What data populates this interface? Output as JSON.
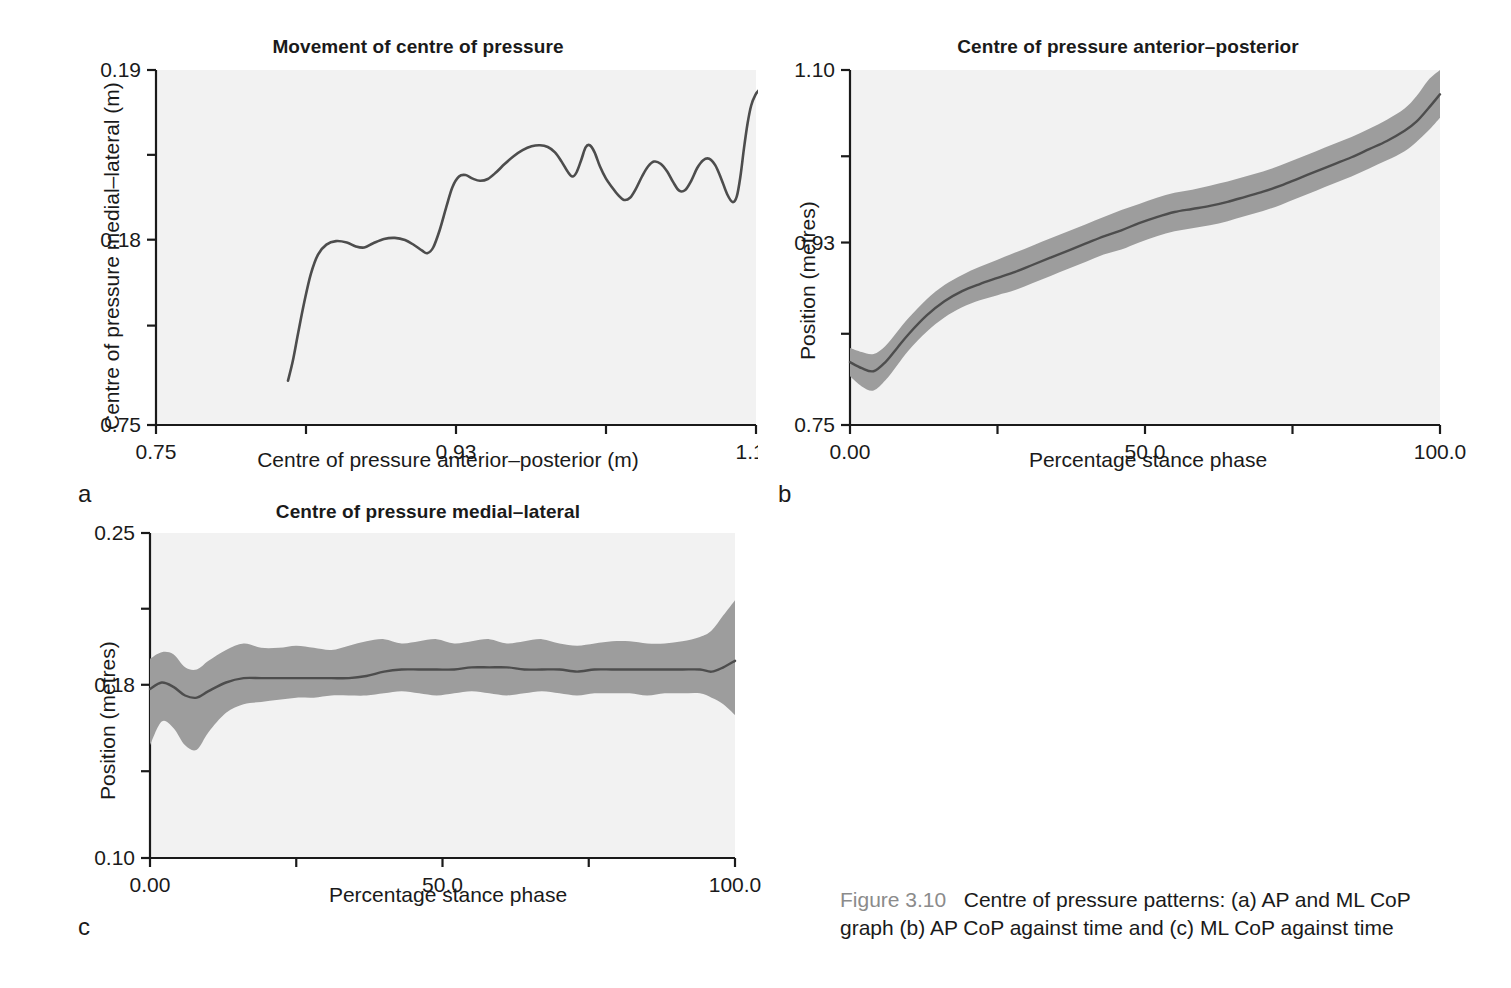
{
  "figure": {
    "number": "Figure 3.10",
    "caption_line1": "Centre of pressure patterns: (a) AP and ML CoP",
    "caption_line2": "graph (b) AP CoP against time and (c) ML CoP against time",
    "fignum_color": "#8b8b8b"
  },
  "colors": {
    "plot_background": "#f2f2f2",
    "band_fill": "#9d9d9d",
    "line": "#4d4d4d",
    "axis": "#1a1a1a",
    "text": "#1a1a1a"
  },
  "panels": {
    "a": {
      "letter": "a"
    },
    "b": {
      "letter": "b"
    },
    "c": {
      "letter": "c"
    }
  },
  "chart_data": [
    {
      "id": "a",
      "type": "line",
      "title": "Movement of centre of pressure",
      "xlabel": "Centre of pressure anterior–posterior (m)",
      "ylabel": "Centre of pressure medial–lateral (m)",
      "xlim": [
        0.75,
        1.1
      ],
      "ylim": [
        0.75,
        0.19
      ],
      "xticks": [
        0.75,
        0.93,
        1.1
      ],
      "xticklabels": [
        "0.75",
        "0.93",
        "1.10"
      ],
      "yticks": [
        0.19,
        0.18,
        0.75
      ],
      "yticklabels": [
        "0.19",
        "0.18",
        "0.75"
      ],
      "ytick_positions_frac": [
        0.0,
        0.478,
        1.0
      ],
      "xtick_positions_frac": [
        0.0,
        0.5,
        1.0
      ],
      "grid": false,
      "legend": "none",
      "note": "Butterfly CoP trace: ML position plotted against AP position. Values given as fractional positions within the plot box; x 0=left(0.75) 1=right(1.10); y 0=top(0.19) 1=bottom(0.75)",
      "series": [
        {
          "name": "Centre of pressure trace",
          "points_frac": [
            [
              0.22,
              0.875
            ],
            [
              0.228,
              0.82
            ],
            [
              0.237,
              0.74
            ],
            [
              0.247,
              0.655
            ],
            [
              0.258,
              0.575
            ],
            [
              0.27,
              0.52
            ],
            [
              0.284,
              0.492
            ],
            [
              0.3,
              0.482
            ],
            [
              0.318,
              0.486
            ],
            [
              0.333,
              0.497
            ],
            [
              0.347,
              0.5
            ],
            [
              0.362,
              0.488
            ],
            [
              0.38,
              0.476
            ],
            [
              0.398,
              0.473
            ],
            [
              0.415,
              0.479
            ],
            [
              0.43,
              0.493
            ],
            [
              0.443,
              0.508
            ],
            [
              0.452,
              0.516
            ],
            [
              0.462,
              0.5
            ],
            [
              0.473,
              0.45
            ],
            [
              0.484,
              0.385
            ],
            [
              0.494,
              0.33
            ],
            [
              0.505,
              0.3
            ],
            [
              0.516,
              0.296
            ],
            [
              0.528,
              0.306
            ],
            [
              0.54,
              0.312
            ],
            [
              0.553,
              0.307
            ],
            [
              0.567,
              0.288
            ],
            [
              0.581,
              0.265
            ],
            [
              0.596,
              0.243
            ],
            [
              0.611,
              0.226
            ],
            [
              0.626,
              0.215
            ],
            [
              0.64,
              0.212
            ],
            [
              0.653,
              0.217
            ],
            [
              0.665,
              0.232
            ],
            [
              0.676,
              0.258
            ],
            [
              0.686,
              0.286
            ],
            [
              0.694,
              0.3
            ],
            [
              0.701,
              0.288
            ],
            [
              0.709,
              0.252
            ],
            [
              0.716,
              0.218
            ],
            [
              0.723,
              0.212
            ],
            [
              0.731,
              0.232
            ],
            [
              0.74,
              0.272
            ],
            [
              0.75,
              0.306
            ],
            [
              0.76,
              0.33
            ],
            [
              0.77,
              0.352
            ],
            [
              0.78,
              0.366
            ],
            [
              0.79,
              0.36
            ],
            [
              0.8,
              0.334
            ],
            [
              0.81,
              0.3
            ],
            [
              0.82,
              0.272
            ],
            [
              0.83,
              0.258
            ],
            [
              0.841,
              0.264
            ],
            [
              0.852,
              0.286
            ],
            [
              0.862,
              0.316
            ],
            [
              0.872,
              0.34
            ],
            [
              0.882,
              0.338
            ],
            [
              0.892,
              0.312
            ],
            [
              0.902,
              0.276
            ],
            [
              0.912,
              0.254
            ],
            [
              0.922,
              0.25
            ],
            [
              0.932,
              0.268
            ],
            [
              0.942,
              0.306
            ],
            [
              0.952,
              0.35
            ],
            [
              0.961,
              0.372
            ],
            [
              0.968,
              0.356
            ],
            [
              0.974,
              0.3
            ],
            [
              0.98,
              0.22
            ],
            [
              0.986,
              0.15
            ],
            [
              0.992,
              0.1
            ],
            [
              0.999,
              0.07
            ],
            [
              1.006,
              0.055
            ],
            [
              1.014,
              0.048
            ],
            [
              1.022,
              0.046
            ],
            [
              1.032,
              0.046
            ]
          ]
        }
      ]
    },
    {
      "id": "b",
      "type": "line",
      "title": "Centre of pressure anterior–posterior",
      "xlabel": "Percentage stance phase",
      "ylabel": "Position (metres)",
      "xlim": [
        0.0,
        100.0
      ],
      "ylim": [
        0.75,
        1.1
      ],
      "xticks": [
        0.0,
        50.0,
        100.0
      ],
      "xticklabels": [
        "0.00",
        "50.0",
        "100.0"
      ],
      "yticks": [
        1.1,
        0.93,
        0.75
      ],
      "yticklabels": [
        "1.10",
        "0.93",
        "0.75"
      ],
      "ytick_positions_frac": [
        0.0,
        0.486,
        1.0
      ],
      "xtick_positions_frac": [
        0.0,
        0.5,
        1.0
      ],
      "grid": false,
      "legend": "none",
      "band": "mean ± 1 standard deviation (grey shaded)",
      "x_percent": [
        0,
        2,
        4,
        6,
        8,
        10,
        13,
        16,
        19,
        22,
        25,
        28,
        31,
        34,
        37,
        40,
        43,
        46,
        49,
        52,
        55,
        58,
        61,
        64,
        67,
        70,
        73,
        76,
        79,
        82,
        85,
        88,
        91,
        94,
        96,
        98,
        100
      ],
      "mean": [
        0.812,
        0.806,
        0.803,
        0.812,
        0.826,
        0.84,
        0.858,
        0.872,
        0.882,
        0.889,
        0.895,
        0.901,
        0.908,
        0.915,
        0.922,
        0.929,
        0.936,
        0.942,
        0.949,
        0.955,
        0.96,
        0.963,
        0.966,
        0.97,
        0.975,
        0.98,
        0.986,
        0.993,
        1.0,
        1.007,
        1.014,
        1.022,
        1.03,
        1.04,
        1.049,
        1.062,
        1.076
      ],
      "sd_upper": [
        0.826,
        0.822,
        0.82,
        0.828,
        0.842,
        0.856,
        0.874,
        0.888,
        0.898,
        0.906,
        0.913,
        0.92,
        0.927,
        0.934,
        0.941,
        0.948,
        0.955,
        0.962,
        0.968,
        0.974,
        0.979,
        0.982,
        0.986,
        0.99,
        0.995,
        1.0,
        1.006,
        1.013,
        1.02,
        1.027,
        1.034,
        1.042,
        1.051,
        1.062,
        1.074,
        1.09,
        1.1
      ],
      "sd_lower": [
        0.798,
        0.788,
        0.784,
        0.794,
        0.809,
        0.824,
        0.842,
        0.856,
        0.866,
        0.873,
        0.878,
        0.883,
        0.89,
        0.897,
        0.904,
        0.911,
        0.918,
        0.923,
        0.93,
        0.936,
        0.941,
        0.944,
        0.947,
        0.951,
        0.956,
        0.961,
        0.967,
        0.974,
        0.981,
        0.988,
        0.995,
        1.003,
        1.011,
        1.02,
        1.029,
        1.04,
        1.053
      ]
    },
    {
      "id": "c",
      "type": "line",
      "title": "Centre of pressure medial–lateral",
      "xlabel": "Percentage stance phase",
      "ylabel": "Position (metres)",
      "xlim": [
        0.0,
        100.0
      ],
      "ylim": [
        0.1,
        0.25
      ],
      "xticks": [
        0.0,
        50.0,
        100.0
      ],
      "xticklabels": [
        "0.00",
        "50.0",
        "100.0"
      ],
      "yticks": [
        0.25,
        0.18,
        0.1
      ],
      "yticklabels": [
        "0.25",
        "0.18",
        "0.10"
      ],
      "ytick_positions_frac": [
        0.0,
        0.467,
        1.0
      ],
      "xtick_positions_frac": [
        0.0,
        0.5,
        1.0
      ],
      "grid": false,
      "legend": "none",
      "band": "mean ± 1 standard deviation (grey shaded)",
      "x_percent": [
        0,
        2,
        4,
        6,
        8,
        10,
        13,
        16,
        19,
        22,
        25,
        28,
        31,
        34,
        37,
        40,
        43,
        46,
        49,
        52,
        55,
        58,
        61,
        64,
        67,
        70,
        73,
        76,
        79,
        82,
        85,
        88,
        91,
        94,
        96,
        98,
        100
      ],
      "mean": [
        0.178,
        0.181,
        0.179,
        0.175,
        0.174,
        0.177,
        0.181,
        0.183,
        0.183,
        0.183,
        0.183,
        0.183,
        0.183,
        0.183,
        0.184,
        0.186,
        0.187,
        0.187,
        0.187,
        0.187,
        0.188,
        0.188,
        0.188,
        0.187,
        0.187,
        0.187,
        0.186,
        0.187,
        0.187,
        0.187,
        0.187,
        0.187,
        0.187,
        0.187,
        0.186,
        0.188,
        0.191
      ],
      "sd_upper": [
        0.192,
        0.195,
        0.194,
        0.188,
        0.187,
        0.191,
        0.196,
        0.199,
        0.197,
        0.197,
        0.198,
        0.197,
        0.196,
        0.198,
        0.2,
        0.201,
        0.199,
        0.2,
        0.201,
        0.199,
        0.2,
        0.201,
        0.199,
        0.2,
        0.201,
        0.199,
        0.198,
        0.199,
        0.2,
        0.2,
        0.199,
        0.199,
        0.2,
        0.202,
        0.205,
        0.212,
        0.219
      ],
      "sd_lower": [
        0.152,
        0.163,
        0.16,
        0.152,
        0.15,
        0.158,
        0.167,
        0.171,
        0.172,
        0.173,
        0.174,
        0.174,
        0.175,
        0.175,
        0.175,
        0.176,
        0.177,
        0.176,
        0.175,
        0.176,
        0.177,
        0.176,
        0.175,
        0.176,
        0.177,
        0.176,
        0.175,
        0.176,
        0.176,
        0.176,
        0.175,
        0.176,
        0.176,
        0.176,
        0.174,
        0.171,
        0.166
      ]
    }
  ]
}
